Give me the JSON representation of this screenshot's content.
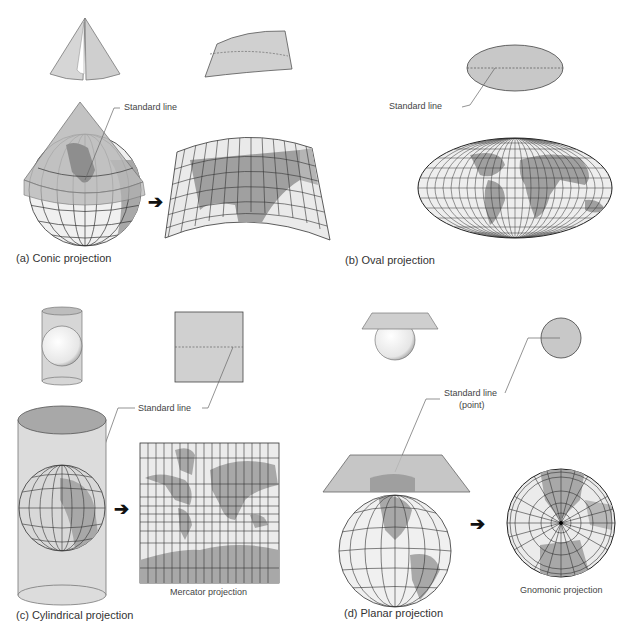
{
  "figure": {
    "colors": {
      "surface": "#c8c8c8",
      "surface_light": "#dcdcdc",
      "land": "#9a9a9a",
      "ocean": "#ececec",
      "grid": "#2a2a2a",
      "leader": "#666666",
      "arrow": "#111111"
    },
    "panels": [
      {
        "id": "a",
        "caption": "(a) Conic projection",
        "standard_line_label": "Standard line",
        "surface_shape": "cone",
        "result_shape": "conic-fan"
      },
      {
        "id": "b",
        "caption": "(b) Oval projection",
        "standard_line_label": "Standard line",
        "surface_shape": "ellipse",
        "result_shape": "oval-world-map"
      },
      {
        "id": "c",
        "caption": "(c) Cylindrical projection",
        "standard_line_label": "Standard line",
        "surface_shape": "cylinder",
        "result_shape": "rectangular-world-map",
        "result_label": "Mercator projection"
      },
      {
        "id": "d",
        "caption": "(d) Planar projection",
        "standard_line_label": "Standard line",
        "standard_line_sublabel": "(point)",
        "surface_shape": "plane",
        "result_shape": "circular-polar-map",
        "result_label": "Gnomonic projection"
      }
    ],
    "arrow_glyph": "➔"
  }
}
